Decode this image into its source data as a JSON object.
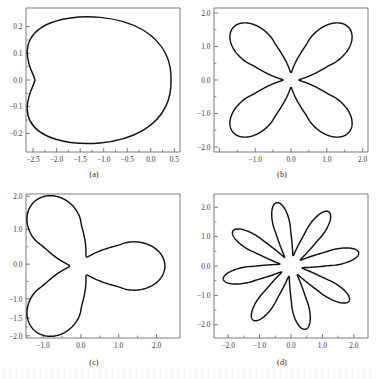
{
  "figure": {
    "background": "#ffffff",
    "curve_color": "#111111",
    "axis_color": "#6d6d6d",
    "bottom_artifact_text": ""
  },
  "panels": [
    {
      "id": "a",
      "caption": "(a)",
      "xticks": [
        "-2.5",
        "-2.0",
        "-1.5",
        "-1.0",
        "-0.5",
        "0.0",
        "0.5"
      ],
      "xtick_values": [
        -2.5,
        -2.0,
        -1.5,
        -1.0,
        -0.5,
        0.0,
        0.5
      ],
      "yticks": [
        "0.2",
        "0.1",
        "0.0",
        "-0.1",
        "-0.2"
      ],
      "ytick_values": [
        0.2,
        0.1,
        0.0,
        -0.1,
        -0.2
      ],
      "xlim": [
        -2.65,
        0.62
      ],
      "ylim": [
        -0.27,
        0.27
      ]
    },
    {
      "id": "b",
      "caption": "(b)",
      "xticks": [
        "",
        "-1.0",
        "0.0",
        "1.0",
        "2.0"
      ],
      "xtick_values": [
        -2.0,
        -1.0,
        0.0,
        1.0,
        2.0
      ],
      "yticks": [
        "2.0",
        "1.0",
        "0.0",
        "-1.0",
        "-2.0"
      ],
      "ytick_values": [
        2.0,
        1.0,
        0.0,
        -1.0,
        -2.0
      ],
      "xlim": [
        -2.15,
        2.15
      ],
      "ylim": [
        -2.15,
        2.15
      ]
    },
    {
      "id": "c",
      "caption": "(c)",
      "xticks": [
        "-1.0",
        "0.0",
        "1.0",
        "2.0"
      ],
      "xtick_values": [
        -1.0,
        0.0,
        1.0,
        2.0
      ],
      "yticks": [
        "2.0",
        "1.0",
        "0.0",
        "-1.0",
        "-1.5",
        "-2.0"
      ],
      "ytick_values": [
        2.0,
        1.0,
        0.0,
        -1.0,
        -1.5,
        -2.0
      ],
      "xlim": [
        -1.45,
        2.62
      ],
      "ylim": [
        -2.05,
        2.05
      ]
    },
    {
      "id": "d",
      "caption": "(d)",
      "xticks": [
        "-2.0",
        "-1.0",
        "0.0",
        "1.0",
        "2.0"
      ],
      "xtick_values": [
        -2.0,
        -1.0,
        0.0,
        1.0,
        2.0
      ],
      "yticks": [
        "2.0",
        "1.0",
        "0.0",
        "-1.0",
        "-2.0"
      ],
      "ytick_values": [
        2.0,
        1.0,
        0.0,
        -1.0,
        -2.0
      ],
      "xlim": [
        -2.45,
        2.45
      ],
      "ylim": [
        -2.45,
        2.45
      ]
    }
  ],
  "chart_data": [
    {
      "type": "line",
      "panel": "a",
      "title": "(a)",
      "xlabel": "",
      "ylabel": "",
      "xlim": [
        -2.65,
        0.62
      ],
      "ylim": [
        -0.27,
        0.27
      ],
      "grid": false,
      "legend": "none",
      "description": "single closed rounded-triangular orbit, apex pointing left",
      "xticklabels": [
        "-2.5",
        "-2.0",
        "-1.5",
        "-1.0",
        "-0.5",
        "0.0",
        "0.5"
      ],
      "yticklabels": [
        "0.2",
        "0.1",
        "0.0",
        "-0.1",
        "-0.2"
      ],
      "series": [
        {
          "name": "orbit",
          "x": [
            0.06,
            0.05,
            0.02,
            -0.06,
            -0.2,
            -0.38,
            -0.58,
            -0.8,
            -1.05,
            -1.32,
            -1.6,
            -1.85,
            -2.05,
            -2.17,
            -2.22,
            -2.2,
            -2.1,
            -1.92,
            -1.68,
            -1.42,
            -1.15,
            -0.9,
            -0.66,
            -0.45,
            -0.27,
            -0.13,
            -0.03,
            0.03,
            0.06
          ],
          "y": [
            0.0,
            0.07,
            0.13,
            0.17,
            0.2,
            0.215,
            0.222,
            0.221,
            0.214,
            0.202,
            0.183,
            0.158,
            0.122,
            0.08,
            0.03,
            -0.025,
            -0.075,
            -0.118,
            -0.155,
            -0.183,
            -0.203,
            -0.216,
            -0.222,
            -0.221,
            -0.21,
            -0.186,
            -0.145,
            -0.08,
            0.0
          ]
        }
      ]
    },
    {
      "type": "line",
      "panel": "b",
      "title": "(b)",
      "xlabel": "",
      "ylabel": "",
      "xlim": [
        -2.15,
        2.15
      ],
      "ylim": [
        -2.15,
        2.15
      ],
      "grid": false,
      "legend": "none",
      "description": "4-petal rosette orbit, petals along the diagonals, small rounded central loop",
      "xticklabels": [
        "",
        "-1.0",
        "0.0",
        "1.0",
        "2.0"
      ],
      "yticklabels": [
        "2.0",
        "1.0",
        "0.0",
        "-1.0",
        "-2.0"
      ],
      "petals": 4,
      "r_min": 0.22,
      "r_max": 2.25,
      "petal_angles_deg": [
        45,
        135,
        225,
        315
      ]
    },
    {
      "type": "line",
      "panel": "c",
      "title": "(c)",
      "xlabel": "",
      "ylabel": "",
      "xlim": [
        -1.45,
        2.62
      ],
      "ylim": [
        -2.05,
        2.05
      ],
      "grid": false,
      "legend": "none",
      "description": "3-petal rosette orbit with small central loop; petals at 0, 120 and 240 degrees",
      "xticklabels": [
        "-1.0",
        "0.0",
        "1.0",
        "2.0"
      ],
      "yticklabels": [
        "2.0",
        "1.0",
        "0.0",
        "-1.0",
        "-1.5",
        "-2.0"
      ],
      "petals": 3,
      "r_min": 0.3,
      "r_max": 2.22,
      "petal_angles_deg": [
        0,
        120,
        240
      ]
    },
    {
      "type": "line",
      "panel": "d",
      "title": "(d)",
      "xlabel": "",
      "ylabel": "",
      "xlim": [
        -2.45,
        2.45
      ],
      "ylim": [
        -2.45,
        2.45
      ],
      "grid": false,
      "legend": "none",
      "description": "8-petal rosette orbit with circular central hole",
      "xticklabels": [
        "-2.0",
        "-1.0",
        "0.0",
        "1.0",
        "2.0"
      ],
      "yticklabels": [
        "2.0",
        "1.0",
        "0.0",
        "-1.0",
        "-2.0"
      ],
      "petals": 8,
      "r_min": 0.36,
      "r_max": 2.2,
      "petal_angles_deg": [
        12,
        57,
        102,
        147,
        192,
        237,
        282,
        327
      ]
    }
  ]
}
